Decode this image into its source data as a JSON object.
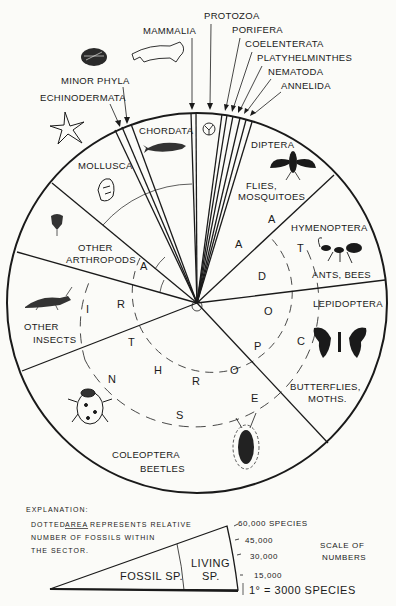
{
  "diagram": {
    "top_labels": {
      "mammalia": "MAMMALIA",
      "protozoa": "PROTOZOA",
      "porifera": "PORIFERA",
      "coelenterata": "COELENTERATA",
      "platyhelminthes": "PLATYHELMINTHES",
      "nematoda": "NEMATODA",
      "annelida": "ANNELIDA",
      "minor_phyla": "MINOR PHYLA",
      "echinodermata": "ECHINODERMATA"
    },
    "sectors": {
      "chordata": "CHORDATA",
      "mollusca": "MOLLUSCA",
      "other_arthropods_1": "OTHER",
      "other_arthropods_2": "ARTHROPODS",
      "other_insects_1": "OTHER",
      "other_insects_2": "INSECTS",
      "coleoptera_1": "COLEOPTERA",
      "coleoptera_2": "BEETLES",
      "lepidoptera_1": "LEPIDOPTERA",
      "lepidoptera_2": "BUTTERFLIES,",
      "lepidoptera_3": "MOTHS.",
      "hymenoptera_1": "HYMENOPTERA",
      "hymenoptera_2": "ANTS, BEES",
      "diptera_1": "DIPTERA",
      "diptera_2": "FLIES,",
      "diptera_3": "MOSQUITOES"
    },
    "ring_arthropoda": [
      "A",
      "R",
      "T",
      "H",
      "R",
      "O",
      "P",
      "O",
      "D",
      "A"
    ],
    "ring_insecta": [
      "I",
      "N",
      "S",
      "E",
      "C",
      "T",
      "A"
    ],
    "icons": [
      "cat-icon",
      "brachiopod-shell-icon",
      "starfish-icon",
      "fish-icon",
      "radiolarian-icon",
      "snail-shell-icon",
      "trilobite-icon",
      "grasshopper-icon",
      "ladybug-icon",
      "water-beetle-icon",
      "butterfly-icon",
      "ant-icon",
      "fly-icon"
    ]
  },
  "explanation": {
    "title": "EXPLANATION:",
    "line1_a": "DOTTED",
    "line1_b": "AREA",
    "line1_c": "REPRESENTS RELATIVE",
    "line2": "NUMBER OF FOSSILS WITHIN",
    "line3": "THE SECTOR."
  },
  "scale": {
    "fossil_label": "FOSSIL SP.",
    "living_label_1": "LIVING",
    "living_label_2": "SP.",
    "ticks": [
      "60,000 SPECIES",
      "45,000",
      "30,000",
      "15,000"
    ],
    "unit": "1° = 3000 SPECIES",
    "title_1": "SCALE OF",
    "title_2": "NUMBERS"
  }
}
